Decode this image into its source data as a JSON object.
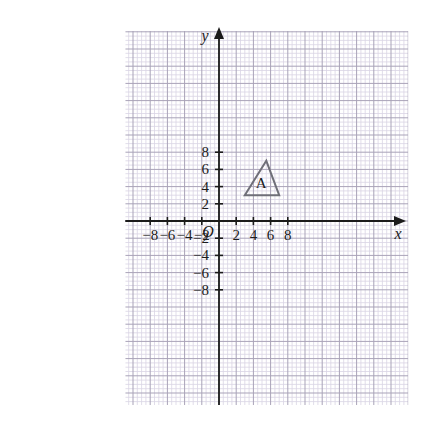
{
  "figure": {
    "background_color": "#ffffff",
    "grid": {
      "minor_color": "#d9d4e4",
      "major_color": "#a9a3b8",
      "minor_step_units": 0.5,
      "major_step_units": 2,
      "x_min": -10.9,
      "x_max": 22.0,
      "y_min": -21.4,
      "y_max": 22.1
    },
    "axes": {
      "color": "#1b1b1b",
      "x_label": "x",
      "y_label": "y",
      "origin_label": "O",
      "x_tick_labels": [
        "−8",
        "−6",
        "−4",
        "−2",
        "2",
        "4",
        "6",
        "8"
      ],
      "x_tick_values": [
        -8,
        -6,
        -4,
        -2,
        2,
        4,
        6,
        8
      ],
      "y_tick_labels": [
        "8",
        "6",
        "4",
        "2",
        "−2",
        "−4",
        "−6",
        "−8"
      ],
      "y_tick_values": [
        8,
        6,
        4,
        2,
        -2,
        -4,
        -6,
        -8
      ]
    }
  },
  "chart_data": {
    "type": "scatter",
    "title": "",
    "xlabel": "x",
    "ylabel": "y",
    "xlim": [
      -10.9,
      22.0
    ],
    "ylim": [
      -21.4,
      22.1
    ],
    "grid": true,
    "legend": "none",
    "shapes": [
      {
        "name": "A",
        "label": "A",
        "kind": "triangle",
        "stroke_color": "#6f6f78",
        "fill": "none",
        "vertices": [
          [
            3,
            3
          ],
          [
            7,
            3
          ],
          [
            5.5,
            7
          ]
        ],
        "label_position": [
          4.9,
          4.2
        ]
      }
    ]
  }
}
